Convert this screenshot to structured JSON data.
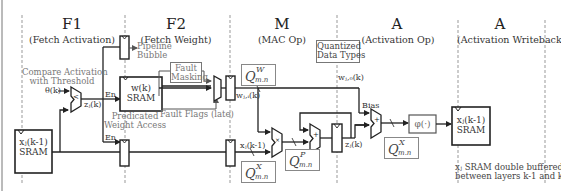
{
  "stages": [
    {
      "id": "F1",
      "title": "F1",
      "subtitle": "(Fetch Activation)"
    },
    {
      "id": "F2",
      "title": "F2",
      "subtitle": "(Fetch Weight)"
    },
    {
      "id": "M",
      "title": "M",
      "subtitle": "(MAC Op)"
    },
    {
      "id": "A1",
      "title": "A",
      "subtitle": "(Activation Op)"
    },
    {
      "id": "A2",
      "title": "A",
      "subtitle": "(Activation Writeback)"
    }
  ],
  "annotations": {
    "compare": "Compare Activation\nwith Threshold",
    "pipeline_bubble": "Pipeline\nBubble",
    "fault_masking": "Fault\nMasking",
    "predicated_weight": "Predicated\nWeight Access",
    "fault_flags": "Fault Flags (late)",
    "quantized": "Quantized\nData Types",
    "double_buffered": "xⱼ SRAM double buffered\nbetween layers k-1 and k"
  },
  "signals": {
    "theta": "θ(k)",
    "z": "zⱼ(k)",
    "en1": "En",
    "en2": "En",
    "w_ji": "wⱼ,ᵢ(k)",
    "w_j0": "wⱼ,₀(k)",
    "x_km1": "xⱼ(k-1)",
    "bias": "Bias",
    "z2": "zⱼ(k)"
  },
  "blocks": {
    "sram_x": "xⱼ(k-1)\nSRAM",
    "sram_w": "w(k)\nSRAM",
    "phi": "φ(·)",
    "sram_x_out": "xⱼ(k-1)\nSRAM",
    "op_mult": "×",
    "op_add": "+",
    "op_bias": "+",
    "op_cmp": "<"
  },
  "quant": {
    "w": {
      "base": "Q",
      "sup": "W",
      "sub": "m.n"
    },
    "x_in": {
      "base": "Q",
      "sup": "X",
      "sub": "m.n"
    },
    "p": {
      "base": "Q",
      "sup": "P",
      "sub": "m.n"
    },
    "x_out": {
      "base": "Q",
      "sup": "X",
      "sub": "m.n"
    }
  }
}
